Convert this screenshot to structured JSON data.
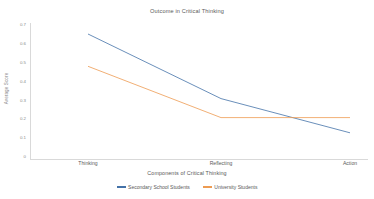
{
  "chart_data": {
    "type": "line",
    "title": "Outcome in Critical Thinking",
    "xlabel": "Components of Critical Thinking",
    "ylabel": "Average Score",
    "categories": [
      "Thinking",
      "Reflecting",
      "Action"
    ],
    "ylim": [
      0,
      0.7
    ],
    "yticks": [
      "0.7",
      "0.6",
      "0.5",
      "0.4",
      "0.3",
      "0.2",
      "0.1",
      "0"
    ],
    "grid": false,
    "legend_position": "bottom",
    "series": [
      {
        "name": "Secondary School Students",
        "color": "#4472a8",
        "values": [
          0.65,
          0.31,
          0.13
        ]
      },
      {
        "name": "University Students",
        "color": "#ed9b52",
        "values": [
          0.48,
          0.21,
          0.21
        ]
      }
    ]
  },
  "colors": {
    "series_blue": "#4472a8",
    "series_orange": "#ed9b52",
    "axis": "#d9d9d9",
    "text": "#595959"
  }
}
